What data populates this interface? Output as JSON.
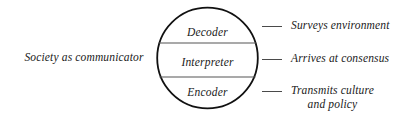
{
  "figure": {
    "left_label": "Society as communicator",
    "circle": {
      "bands": [
        {
          "label": "Decoder"
        },
        {
          "label": "Interpreter"
        },
        {
          "label": "Encoder"
        }
      ]
    },
    "annotations": [
      {
        "line1": "Surveys environment",
        "line2": ""
      },
      {
        "line1": "Arrives at consensus",
        "line2": ""
      },
      {
        "line1": "Transmits culture",
        "line2": "and policy"
      }
    ],
    "colors": {
      "background": "#ffffff",
      "text": "#1a1a1a",
      "circle_outline": "#111111",
      "divider": "#555555",
      "connector": "#4a4a4a"
    }
  }
}
